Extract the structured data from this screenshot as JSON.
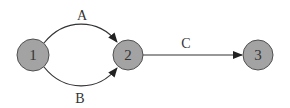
{
  "diagram": {
    "type": "directed-graph",
    "nodes": [
      {
        "id": "1",
        "label": "1",
        "cx": 33,
        "cy": 55,
        "r": 16
      },
      {
        "id": "2",
        "label": "2",
        "cx": 128,
        "cy": 55,
        "r": 15
      },
      {
        "id": "3",
        "label": "3",
        "cx": 258,
        "cy": 55,
        "r": 15
      }
    ],
    "edges": [
      {
        "id": "A",
        "label": "A",
        "from": "1",
        "to": "2",
        "shape": "upper-arc"
      },
      {
        "id": "B",
        "label": "B",
        "from": "1",
        "to": "2",
        "shape": "lower-arc"
      },
      {
        "id": "C",
        "label": "C",
        "from": "2",
        "to": "3",
        "shape": "straight"
      }
    ],
    "colors": {
      "node_fill": "#a3a3a3",
      "node_stroke": "#505050",
      "edge": "#333333",
      "text": "#333333"
    }
  }
}
